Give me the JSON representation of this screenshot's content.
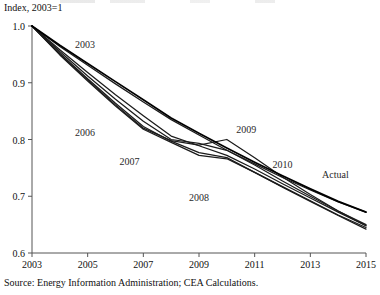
{
  "chart_data": {
    "type": "line",
    "title": "",
    "subtitle": "",
    "xlabel": "",
    "ylabel": "Index, 2003=1",
    "axis_note": "Index, 2003=1",
    "xlim": [
      2003,
      2015
    ],
    "ylim": [
      0.6,
      1.0
    ],
    "grid": false,
    "legend_position": "inline-annotations",
    "x_ticks": [
      "2003",
      "2005",
      "2007",
      "2009",
      "2011",
      "2013",
      "2015"
    ],
    "y_ticks": [
      "1.0",
      "0.9",
      "0.8",
      "0.7",
      "0.6"
    ],
    "x_tick_values": [
      2003,
      2005,
      2007,
      2009,
      2011,
      2013,
      2015
    ],
    "y_tick_values": [
      1.0,
      0.9,
      0.8,
      0.7,
      0.6
    ],
    "annotations": [
      {
        "text": "2003",
        "x": 2004.9,
        "y": 0.962
      },
      {
        "text": "2006",
        "x": 2004.9,
        "y": 0.807
      },
      {
        "text": "2007",
        "x": 2006.5,
        "y": 0.755
      },
      {
        "text": "2008",
        "x": 2009.0,
        "y": 0.692
      },
      {
        "text": "2009",
        "x": 2010.7,
        "y": 0.812
      },
      {
        "text": "2010",
        "x": 2012.0,
        "y": 0.75
      },
      {
        "text": "Actual",
        "x": 2013.9,
        "y": 0.732
      }
    ],
    "series": [
      {
        "name": "2003",
        "label": "2003",
        "x": [
          2003,
          2004,
          2005,
          2006,
          2007,
          2008,
          2009,
          2010,
          2011,
          2012,
          2013,
          2014,
          2015
        ],
        "values": [
          1.0,
          0.964,
          0.931,
          0.898,
          0.866,
          0.835,
          0.808,
          0.781,
          0.757,
          0.733,
          0.711,
          0.69,
          0.672
        ]
      },
      {
        "name": "2006",
        "label": "2006",
        "x": [
          2003,
          2004,
          2005,
          2006,
          2007,
          2008,
          2009,
          2010,
          2011,
          2012,
          2013,
          2014,
          2015
        ],
        "values": [
          1.0,
          0.958,
          0.918,
          0.879,
          0.842,
          0.806,
          0.789,
          0.772,
          0.748,
          0.722,
          0.697,
          0.672,
          0.648
        ]
      },
      {
        "name": "2007",
        "label": "2007",
        "x": [
          2003,
          2004,
          2005,
          2006,
          2007,
          2008,
          2009,
          2010,
          2011,
          2012,
          2013,
          2014,
          2015
        ],
        "values": [
          1.0,
          0.955,
          0.912,
          0.871,
          0.832,
          0.8,
          0.793,
          0.781,
          0.755,
          0.727,
          0.7,
          0.674,
          0.65
        ]
      },
      {
        "name": "2008",
        "label": "2008",
        "x": [
          2003,
          2004,
          2005,
          2006,
          2007,
          2008,
          2009,
          2010,
          2011,
          2012,
          2013,
          2014,
          2015
        ],
        "values": [
          1.0,
          0.952,
          0.907,
          0.864,
          0.823,
          0.797,
          0.777,
          0.768,
          0.742,
          0.716,
          0.691,
          0.666,
          0.642
        ]
      },
      {
        "name": "2009",
        "label": "2009",
        "x": [
          2003,
          2004,
          2005,
          2006,
          2007,
          2008,
          2009,
          2010,
          2011,
          2012,
          2013,
          2014,
          2015
        ],
        "values": [
          1.0,
          0.95,
          0.905,
          0.861,
          0.82,
          0.798,
          0.79,
          0.8,
          0.768,
          0.734,
          0.703,
          0.674,
          0.648
        ]
      },
      {
        "name": "2010",
        "label": "2010",
        "x": [
          2003,
          2004,
          2005,
          2006,
          2007,
          2008,
          2009,
          2010,
          2011,
          2012,
          2013,
          2014,
          2015
        ],
        "values": [
          1.0,
          0.949,
          0.903,
          0.859,
          0.818,
          0.795,
          0.772,
          0.766,
          0.742,
          0.717,
          0.692,
          0.667,
          0.645
        ]
      },
      {
        "name": "Actual",
        "label": "Actual",
        "x": [
          2003,
          2004,
          2005,
          2006,
          2007,
          2008,
          2009,
          2010,
          2011,
          2012,
          2013,
          2014,
          2015
        ],
        "values": [
          1.0,
          0.966,
          0.934,
          0.902,
          0.87,
          0.838,
          0.811,
          0.785,
          0.76,
          0.736,
          0.713,
          0.691,
          0.672
        ]
      }
    ]
  },
  "source": {
    "note": "Source: Energy Information Administration; CEA Calculations."
  }
}
